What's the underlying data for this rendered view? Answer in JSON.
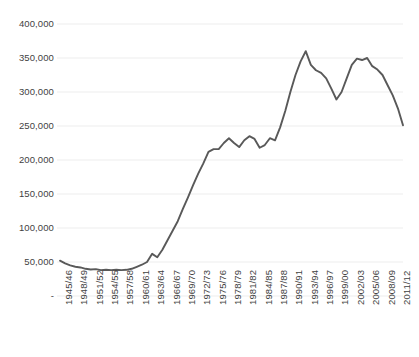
{
  "chart_data": {
    "type": "line",
    "title": "",
    "subtitle": "",
    "xlabel": "",
    "ylabel": "",
    "grid": true,
    "legend": false,
    "legend_position": "none",
    "line_color": "#595959",
    "gridline_color": "#ededed",
    "text_color": "#3f3f3f",
    "background_color": "#ffffff",
    "ylim": [
      0,
      400000
    ],
    "ytick_values": [
      0,
      50000,
      100000,
      150000,
      200000,
      250000,
      300000,
      350000,
      400000
    ],
    "ytick_labels": [
      "-",
      "50,000",
      "100,000",
      "150,000",
      "200,000",
      "250,000",
      "300,000",
      "350,000",
      "400,000"
    ],
    "xtick_labels": [
      "1945/46",
      "1948/49",
      "1951/52",
      "1954/55",
      "1957/58",
      "1960/61",
      "1963/64",
      "1966/67",
      "1969/70",
      "1972/73",
      "1975/76",
      "1978/79",
      "1981/82",
      "1984/85",
      "1987/88",
      "1990/91",
      "1993/94",
      "1996/97",
      "1999/00",
      "2002/03",
      "2005/06",
      "2008/09",
      "2011/12"
    ],
    "xtick_interval_years": 3,
    "x": [
      "1945/46",
      "1946/47",
      "1947/48",
      "1948/49",
      "1949/50",
      "1950/51",
      "1951/52",
      "1952/53",
      "1953/54",
      "1954/55",
      "1955/56",
      "1956/57",
      "1957/58",
      "1958/59",
      "1959/60",
      "1960/61",
      "1961/62",
      "1962/63",
      "1963/64",
      "1964/65",
      "1965/66",
      "1966/67",
      "1967/68",
      "1968/69",
      "1969/70",
      "1970/71",
      "1971/72",
      "1972/73",
      "1973/74",
      "1974/75",
      "1975/76",
      "1976/77",
      "1977/78",
      "1978/79",
      "1979/80",
      "1980/81",
      "1981/82",
      "1982/83",
      "1983/84",
      "1984/85",
      "1985/86",
      "1986/87",
      "1987/88",
      "1988/89",
      "1989/90",
      "1990/91",
      "1991/92",
      "1992/93",
      "1993/94",
      "1994/95",
      "1995/96",
      "1996/97",
      "1997/98",
      "1998/99",
      "1999/00",
      "2000/01",
      "2001/02",
      "2002/03",
      "2003/04",
      "2004/05",
      "2005/06",
      "2006/07",
      "2007/08",
      "2008/09",
      "2009/10",
      "2010/11",
      "2011/12",
      "2012/13"
    ],
    "values": [
      52000,
      48000,
      45000,
      43000,
      42000,
      40000,
      39000,
      39500,
      38000,
      38500,
      38000,
      38500,
      38000,
      38500,
      40000,
      43000,
      46000,
      50000,
      62000,
      57000,
      68000,
      82000,
      96000,
      110000,
      128000,
      145000,
      163000,
      180000,
      195000,
      212000,
      216000,
      216000,
      225000,
      232000,
      225000,
      219000,
      229000,
      235000,
      231000,
      218000,
      222000,
      232000,
      229000,
      248000,
      272000,
      300000,
      325000,
      345000,
      360000,
      340000,
      332000,
      328000,
      320000,
      305000,
      289000,
      300000,
      320000,
      340000,
      349000,
      347000,
      350000,
      338000,
      333000,
      325000,
      310000,
      295000,
      276000,
      251000
    ],
    "series_name": "Value"
  }
}
